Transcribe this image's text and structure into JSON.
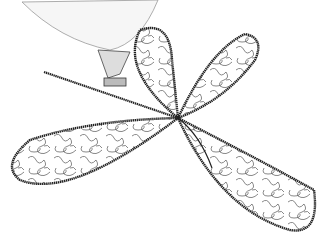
{
  "illustration": {
    "subject": "sewing machine free-motion quilting a four-petal propeller pattern",
    "elements": [
      "sewing-machine-head",
      "presser-foot",
      "petal-top",
      "petal-right",
      "petal-left",
      "petal-bottom"
    ],
    "colors": {
      "background": "#ffffff",
      "outline": "#222222",
      "stipple": "#555555",
      "machine": "#f4f4f4"
    }
  }
}
